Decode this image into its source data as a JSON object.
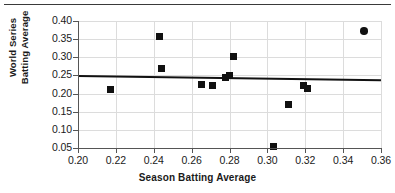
{
  "figure": {
    "has_top_rule": true,
    "background": "#ffffff",
    "marker_color": "#111111",
    "grid_color": "#dcdcdc",
    "axis_color": "#555555"
  },
  "chart_data": {
    "type": "scatter",
    "title": "",
    "xlabel": "Season Batting Average",
    "ylabel_lines": [
      "World Series",
      "Batting Average"
    ],
    "ylabel": "World Series Batting Average",
    "xlim": [
      0.2,
      0.36
    ],
    "ylim": [
      0.05,
      0.4
    ],
    "xticks": [
      0.2,
      0.22,
      0.24,
      0.26,
      0.28,
      0.3,
      0.32,
      0.34,
      0.36
    ],
    "yticks": [
      0.05,
      0.1,
      0.15,
      0.2,
      0.25,
      0.3,
      0.35,
      0.4
    ],
    "xticklabels": [
      "0.20",
      "0.22",
      "0.24",
      "0.26",
      "0.28",
      "0.30",
      "0.32",
      "0.34",
      "0.36"
    ],
    "yticklabels": [
      "0.05",
      "0.10",
      "0.15",
      "0.20",
      "0.25",
      "0.30",
      "0.35",
      "0.40"
    ],
    "grid": true,
    "legend": null,
    "points": [
      {
        "x": 0.217,
        "y": 0.212,
        "marker": "square"
      },
      {
        "x": 0.243,
        "y": 0.357,
        "marker": "square"
      },
      {
        "x": 0.244,
        "y": 0.268,
        "marker": "square"
      },
      {
        "x": 0.265,
        "y": 0.225,
        "marker": "square"
      },
      {
        "x": 0.271,
        "y": 0.221,
        "marker": "square"
      },
      {
        "x": 0.278,
        "y": 0.243,
        "marker": "square"
      },
      {
        "x": 0.28,
        "y": 0.25,
        "marker": "square"
      },
      {
        "x": 0.282,
        "y": 0.303,
        "marker": "square"
      },
      {
        "x": 0.303,
        "y": 0.054,
        "marker": "square"
      },
      {
        "x": 0.311,
        "y": 0.171,
        "marker": "square"
      },
      {
        "x": 0.319,
        "y": 0.223,
        "marker": "square"
      },
      {
        "x": 0.321,
        "y": 0.215,
        "marker": "square"
      },
      {
        "x": 0.351,
        "y": 0.373,
        "marker": "circle"
      }
    ],
    "trendline": {
      "visible": true,
      "x0": 0.2,
      "y0": 0.2475,
      "x1": 0.36,
      "y1": 0.2355
    }
  }
}
